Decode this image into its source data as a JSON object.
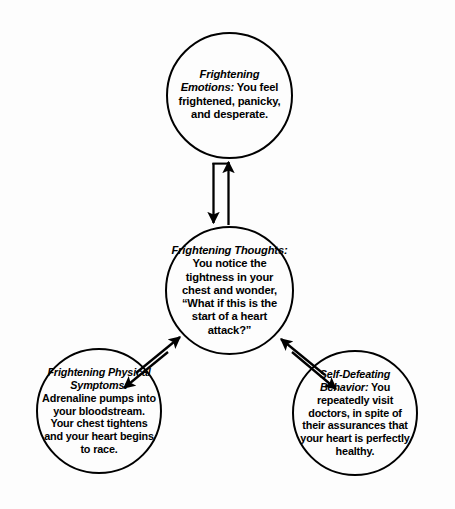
{
  "diagram": {
    "type": "cycle-diagram",
    "background_color": "#fdfdfd",
    "stroke_color": "#000000",
    "nodes": [
      {
        "id": "emotions",
        "label": "Frightening Emotions:",
        "body": "You feel frightened, panicky, and desperate.",
        "position": "top"
      },
      {
        "id": "thoughts",
        "label": "Frightening Thoughts:",
        "body": "You notice the tightness in your chest and wonder, “What if this is the start of a heart attack?”",
        "position": "center"
      },
      {
        "id": "physical",
        "label": "Frightening Physical Symptoms:",
        "body": "Adrenaline pumps into your bloodstream. Your chest tightens and your heart begins to race.",
        "position": "bottom-left"
      },
      {
        "id": "behavior",
        "label": "Self-Defeating Behavior:",
        "body": "You repeatedly visit doctors, in spite of their assurances that your heart is perfectly healthy.",
        "position": "bottom-right"
      }
    ],
    "connectors": [
      {
        "id": "emotions-thoughts",
        "from": "thoughts",
        "to": "emotions",
        "style": "double-arrow-vertical",
        "bidirectional": true
      },
      {
        "id": "thoughts-physical",
        "from": "physical",
        "to": "thoughts",
        "style": "double-arrow-diagonal",
        "bidirectional": true
      },
      {
        "id": "thoughts-behavior",
        "from": "thoughts",
        "to": "behavior",
        "style": "double-arrow-diagonal",
        "bidirectional": true
      }
    ]
  }
}
